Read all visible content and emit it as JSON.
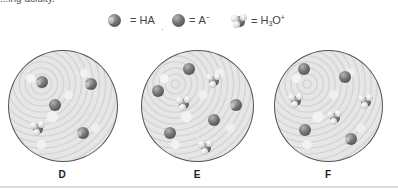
{
  "caption_fragment": "...ing acidity.",
  "legend": [
    {
      "species": "HA",
      "icon": "ha-molecule-icon",
      "label": "HA",
      "sub": "",
      "sup": ""
    },
    {
      "species": "A-",
      "icon": "anion-molecule-icon",
      "label": "A",
      "sub": "",
      "sup": "−"
    },
    {
      "species": "H3O+",
      "icon": "hydronium-molecule-icon",
      "label": "H",
      "sub": "3",
      "tail": "O",
      "sup": "+"
    }
  ],
  "equals": "=",
  "beakers": [
    {
      "label": "D",
      "molecules": [
        {
          "type": "HA",
          "x": 41,
          "y": 82
        },
        {
          "type": "HA",
          "x": 90,
          "y": 84
        },
        {
          "type": "A-",
          "x": 55,
          "y": 105
        },
        {
          "type": "H3O+",
          "x": 37,
          "y": 128
        },
        {
          "type": "HA",
          "x": 82,
          "y": 133
        }
      ]
    },
    {
      "label": "E",
      "molecules": [
        {
          "type": "A-",
          "x": 189,
          "y": 69
        },
        {
          "type": "H3O+",
          "x": 213,
          "y": 80
        },
        {
          "type": "A-",
          "x": 158,
          "y": 91
        },
        {
          "type": "H3O+",
          "x": 183,
          "y": 103
        },
        {
          "type": "HA",
          "x": 235,
          "y": 105
        },
        {
          "type": "A-",
          "x": 214,
          "y": 120
        },
        {
          "type": "A-",
          "x": 170,
          "y": 133
        },
        {
          "type": "H3O+",
          "x": 205,
          "y": 147
        }
      ]
    },
    {
      "label": "F",
      "molecules": [
        {
          "type": "A-",
          "x": 304,
          "y": 69
        },
        {
          "type": "A-",
          "x": 345,
          "y": 77
        },
        {
          "type": "H3O+",
          "x": 295,
          "y": 100
        },
        {
          "type": "H3O+",
          "x": 365,
          "y": 101
        },
        {
          "type": "H3O+",
          "x": 334,
          "y": 117
        },
        {
          "type": "A-",
          "x": 305,
          "y": 130
        },
        {
          "type": "HA",
          "x": 350,
          "y": 139
        }
      ]
    }
  ]
}
